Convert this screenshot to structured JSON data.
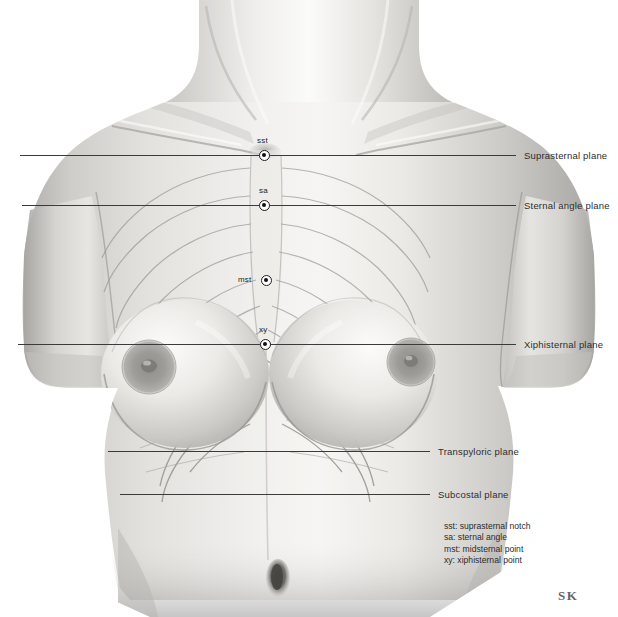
{
  "figure": {
    "background_color": "#ffffff",
    "line_color": "#3b3b3b",
    "skin_light": "#f0efed",
    "skin_mid": "#c9c7c4",
    "skin_dark": "#9d9b98"
  },
  "planes": [
    {
      "id": "suprasternal",
      "label": "Suprasternal plane",
      "y": 155,
      "line_x1": 20,
      "line_x2": 516,
      "label_x": 524,
      "label_y": 150
    },
    {
      "id": "sternal-angle",
      "label": "Sternal angle plane",
      "y": 205,
      "line_x1": 22,
      "line_x2": 516,
      "label_x": 524,
      "label_y": 200
    },
    {
      "id": "xiphisternal",
      "label": "Xiphisternal plane",
      "y": 344,
      "line_x1": 18,
      "line_x2": 516,
      "label_x": 524,
      "label_y": 339
    },
    {
      "id": "transpyloric",
      "label": "Transpyloric plane",
      "y": 451,
      "line_x1": 108,
      "line_x2": 430,
      "label_x": 438,
      "label_y": 446
    },
    {
      "id": "subcostal",
      "label": "Subcostal plane",
      "y": 494,
      "line_x1": 120,
      "line_x2": 430,
      "label_x": 438,
      "label_y": 489
    }
  ],
  "landmarks": [
    {
      "id": "sst",
      "abbr": "sst",
      "name": "suprasternal notch",
      "x": 264,
      "y": 155,
      "label_x": 257,
      "label_y": 136
    },
    {
      "id": "sa",
      "abbr": "sa",
      "name": "sternal angle",
      "x": 264,
      "y": 205,
      "label_x": 259,
      "label_y": 186
    },
    {
      "id": "mst",
      "abbr": "mst",
      "name": "midsternal point",
      "x": 266,
      "y": 280,
      "label_x": 240,
      "label_y": 275
    },
    {
      "id": "xy",
      "abbr": "xy",
      "name": "xiphisternal point",
      "x": 265,
      "y": 344,
      "label_x": 259,
      "label_y": 325
    }
  ],
  "legend": {
    "x": 444,
    "y": 521,
    "lines": [
      "sst: suprasternal notch",
      "sa: sternal angle",
      "mst: midsternal point",
      "xy: xiphisternal point"
    ]
  },
  "signature": {
    "text": "SK",
    "x": 558,
    "y": 588
  }
}
